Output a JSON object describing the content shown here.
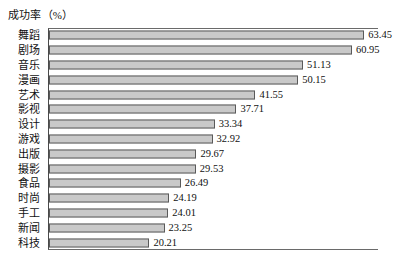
{
  "chart_data": {
    "type": "bar",
    "orientation": "horizontal",
    "title": "成功率（%）",
    "xlabel": "",
    "ylabel": "",
    "grid": false,
    "legend": null,
    "xlim": [
      0,
      66
    ],
    "categories": [
      "舞蹈",
      "剧场",
      "音乐",
      "漫画",
      "艺术",
      "影视",
      "设计",
      "游戏",
      "出版",
      "摄影",
      "食品",
      "时尚",
      "手工",
      "新闻",
      "科技"
    ],
    "values": [
      63.45,
      60.95,
      51.13,
      50.15,
      41.55,
      37.71,
      33.34,
      32.92,
      29.67,
      29.53,
      26.49,
      24.19,
      24.01,
      23.25,
      20.21
    ],
    "value_labels": [
      "63.45",
      "60.95",
      "51.13",
      "50.15",
      "41.55",
      "37.71",
      "33.34",
      "32.92",
      "29.67",
      "29.53",
      "26.49",
      "24.19",
      "24.01",
      "23.25",
      "20.21"
    ],
    "colors": {
      "bar_fill": "#c9c9c9",
      "bar_border": "#5a5a5a",
      "axis": "#4a4a4a",
      "text": "#111111",
      "background": "#ffffff"
    }
  }
}
